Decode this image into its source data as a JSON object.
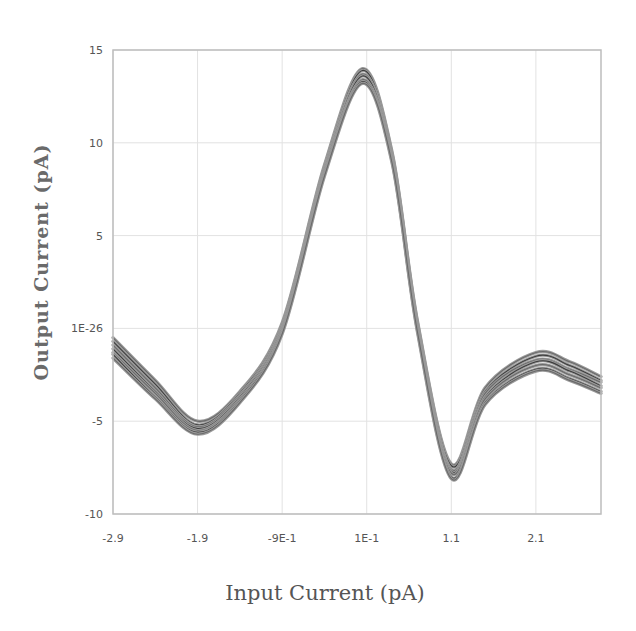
{
  "chart_data": {
    "type": "line",
    "title": "",
    "xlabel": "Input Current (pA)",
    "ylabel": "Output Current (pA)",
    "xlim": [
      -2.9,
      2.87
    ],
    "ylim": [
      -10,
      15
    ],
    "grid": true,
    "legend": "none",
    "x_ticks": [
      {
        "value": -2.9,
        "label": "-2.9"
      },
      {
        "value": -1.9,
        "label": "-1.9"
      },
      {
        "value": -0.9,
        "label": "-9E-1"
      },
      {
        "value": 0.1,
        "label": "1E-1"
      },
      {
        "value": 1.1,
        "label": "1.1"
      },
      {
        "value": 2.1,
        "label": "2.1"
      }
    ],
    "y_ticks": [
      {
        "value": 15,
        "label": "15"
      },
      {
        "value": 10,
        "label": "10"
      },
      {
        "value": 5,
        "label": "5"
      },
      {
        "value": 0,
        "label": "1E-26"
      },
      {
        "value": -5,
        "label": "-5"
      },
      {
        "value": -10,
        "label": "-10"
      }
    ],
    "x": [
      -2.9,
      -2.4,
      -1.9,
      -1.4,
      -0.9,
      -0.4,
      0.05,
      0.4,
      0.7,
      1.1,
      1.5,
      2.1,
      2.5,
      2.87
    ],
    "series": [
      {
        "name": "curve-1",
        "values": [
          -0.5,
          -2.8,
          -5.0,
          -3.4,
          0.3,
          8.8,
          14.0,
          9.5,
          0.4,
          -7.3,
          -3.2,
          -1.3,
          -1.8,
          -2.6
        ]
      },
      {
        "name": "curve-2",
        "values": [
          -0.7,
          -3.0,
          -5.2,
          -3.5,
          0.2,
          8.7,
          13.9,
          9.4,
          0.3,
          -7.4,
          -3.4,
          -1.5,
          -2.0,
          -2.8
        ]
      },
      {
        "name": "curve-3",
        "values": [
          -0.9,
          -3.2,
          -5.3,
          -3.6,
          0.1,
          8.6,
          13.7,
          9.3,
          0.2,
          -7.6,
          -3.5,
          -1.7,
          -2.2,
          -2.9
        ]
      },
      {
        "name": "curve-4",
        "values": [
          -1.1,
          -3.4,
          -5.4,
          -3.7,
          0.0,
          8.5,
          13.6,
          9.2,
          0.1,
          -7.7,
          -3.7,
          -1.8,
          -2.3,
          -3.1
        ]
      },
      {
        "name": "curve-5",
        "values": [
          -1.3,
          -3.5,
          -5.5,
          -3.8,
          -0.1,
          8.4,
          13.4,
          9.1,
          0.0,
          -7.8,
          -3.8,
          -2.0,
          -2.5,
          -3.2
        ]
      },
      {
        "name": "curve-6",
        "values": [
          -1.4,
          -3.7,
          -5.6,
          -3.9,
          -0.2,
          8.3,
          13.3,
          9.0,
          -0.1,
          -8.0,
          -4.0,
          -2.2,
          -2.7,
          -3.4
        ]
      },
      {
        "name": "curve-7",
        "values": [
          -1.6,
          -3.8,
          -5.7,
          -4.0,
          -0.3,
          8.2,
          13.2,
          8.9,
          -0.2,
          -8.1,
          -4.1,
          -2.3,
          -2.8,
          -3.5
        ]
      }
    ],
    "colors": {
      "curve_dark": "#3c3c3c",
      "curve_light": "#9a9a9a",
      "grid": "#e2e2e2",
      "frame": "#bdbdbd",
      "text": "#555555"
    }
  }
}
